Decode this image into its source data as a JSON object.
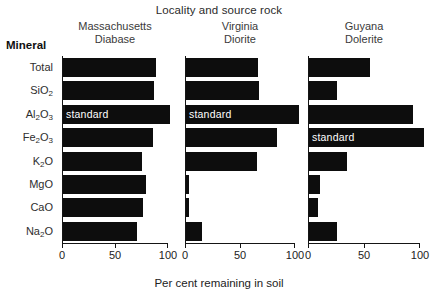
{
  "title": "Locality and source rock",
  "mineral_header": "Mineral",
  "xaxis_title": "Per cent  remaining in soil",
  "standard_label": "standard",
  "colors": {
    "bar": "#0d0d0d",
    "axis": "#151515",
    "text": "#222222",
    "background": "#ffffff",
    "standard_text": "#ffffff"
  },
  "panels": [
    {
      "locality": "Massachusetts",
      "rock": "Diabase"
    },
    {
      "locality": "Virginia",
      "rock": "Diorite"
    },
    {
      "locality": "Guyana",
      "rock": "Dolerite"
    }
  ],
  "tick_labels": [
    "0",
    "50",
    "100"
  ],
  "minerals": [
    {
      "name": "Total",
      "sub": ""
    },
    {
      "name": "SiO",
      "sub": "2"
    },
    {
      "name": "Al",
      "sub": "2",
      "name2": "O",
      "sub2": "3"
    },
    {
      "name": "Fe",
      "sub": "2",
      "name2": "O",
      "sub2": "3"
    },
    {
      "name": "K",
      "sub": "2",
      "name2": "O"
    },
    {
      "name": "MgO",
      "sub": ""
    },
    {
      "name": "CaO",
      "sub": ""
    },
    {
      "name": "Na",
      "sub": "2",
      "name2": "O"
    }
  ],
  "chart_data": {
    "type": "bar",
    "orientation": "horizontal",
    "title": "Locality and source rock",
    "xlabel": "Per cent  remaining in soil",
    "ylabel": "Mineral",
    "xlim": [
      0,
      100
    ],
    "xticks": [
      0,
      50,
      100
    ],
    "grid": false,
    "legend": "none",
    "categories": [
      "Total",
      "SiO2",
      "Al2O3",
      "Fe2O3",
      "K2O",
      "MgO",
      "CaO",
      "Na2O"
    ],
    "series": [
      {
        "name": "Massachusetts Diabase",
        "values": [
          89,
          87,
          102,
          86,
          75,
          79,
          76,
          71
        ],
        "annotations": [
          null,
          null,
          "standard",
          null,
          null,
          null,
          null,
          null
        ]
      },
      {
        "name": "Virginia Diorite",
        "values": [
          66,
          67,
          104,
          84,
          65,
          4,
          4,
          15
        ],
        "annotations": [
          null,
          null,
          "standard",
          null,
          null,
          null,
          null,
          null
        ]
      },
      {
        "name": "Guyana Dolerite",
        "values": [
          55,
          26,
          94,
          104,
          35,
          11,
          9,
          26
        ],
        "annotations": [
          null,
          null,
          null,
          "standard",
          null,
          null,
          null,
          null
        ]
      }
    ]
  }
}
